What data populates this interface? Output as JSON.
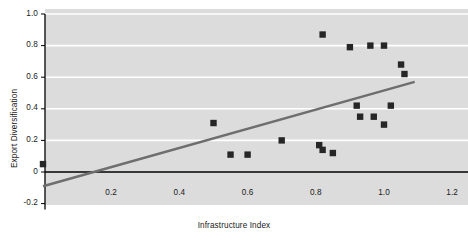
{
  "chart_data": {
    "type": "scatter",
    "title": "",
    "xlabel": "Infrastructure Index",
    "ylabel": "Export Diversification",
    "xlim": [
      -0.02,
      1.27
    ],
    "ylim": [
      -0.2,
      1.0
    ],
    "xticks": [
      "0.2",
      "0.4",
      "0.6",
      "0.8",
      "1.0",
      "1.2"
    ],
    "xtick_values": [
      0.2,
      0.4,
      0.6,
      0.8,
      1.0,
      1.2
    ],
    "yticks": [
      "-0.2",
      "0",
      "0.2",
      "0.4",
      "0.6",
      "0.8",
      "1.0"
    ],
    "ytick_values": [
      -0.2,
      0,
      0.2,
      0.4,
      0.6,
      0.8,
      1.0
    ],
    "grid": "horizontal",
    "grid_color": "#ffffff",
    "plot_background": "#dcdcdc",
    "marker_color": "#262626",
    "marker_shape": "square",
    "legend": "none",
    "points": [
      {
        "x": 0.0,
        "y": 0.05
      },
      {
        "x": 0.5,
        "y": 0.31
      },
      {
        "x": 0.55,
        "y": 0.11
      },
      {
        "x": 0.6,
        "y": 0.11
      },
      {
        "x": 0.7,
        "y": 0.2
      },
      {
        "x": 0.81,
        "y": 0.17
      },
      {
        "x": 0.82,
        "y": 0.87
      },
      {
        "x": 0.82,
        "y": 0.14
      },
      {
        "x": 0.85,
        "y": 0.12
      },
      {
        "x": 0.9,
        "y": 0.79
      },
      {
        "x": 0.92,
        "y": 0.42
      },
      {
        "x": 0.93,
        "y": 0.35
      },
      {
        "x": 0.96,
        "y": 0.8
      },
      {
        "x": 0.97,
        "y": 0.35
      },
      {
        "x": 1.0,
        "y": 0.8
      },
      {
        "x": 1.0,
        "y": 0.3
      },
      {
        "x": 1.02,
        "y": 0.42
      },
      {
        "x": 1.05,
        "y": 0.68
      },
      {
        "x": 1.06,
        "y": 0.62
      }
    ],
    "trendline": {
      "color": "#6e6e6e",
      "x0": 0.0,
      "y0": -0.09,
      "x1": 1.09,
      "y1": 0.57
    },
    "zero_axis_line_color": "#000000"
  }
}
